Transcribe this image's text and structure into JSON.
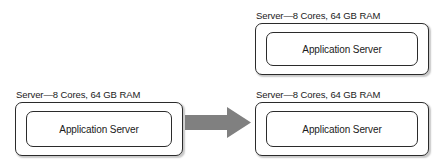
{
  "diagram": {
    "type": "before-after-architecture",
    "background_color": "#ffffff",
    "stroke_color": "#2b2b2b",
    "arrow_color": "#808080",
    "before": {
      "servers": [
        {
          "id": "server-left",
          "label": "Server—8 Cores, 64 GB RAM",
          "component": "Application Server"
        }
      ]
    },
    "after": {
      "servers": [
        {
          "id": "server-top-right",
          "label": "Server—8 Cores, 64 GB RAM",
          "component": "Application Server"
        },
        {
          "id": "server-bottom-right",
          "label": "Server—8 Cores, 64 GB RAM",
          "component": "Application Server"
        }
      ]
    },
    "arrow": {
      "name": "transition-arrow",
      "direction": "right",
      "color": "#808080"
    }
  }
}
